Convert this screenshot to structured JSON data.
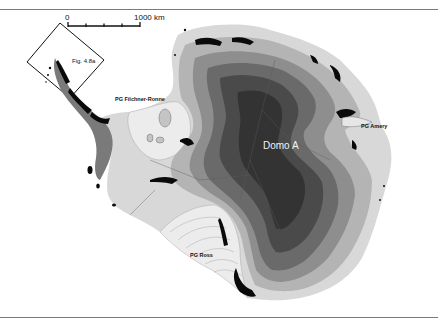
{
  "map": {
    "type": "ice-sheet-elevation-map",
    "region": "Antarctica",
    "labels": {
      "domo": "Domo A",
      "filchner_ronne": "PG Filchner-Ronne",
      "amery": "PG Amery",
      "ross": "PG Ross",
      "figure_box": "Fig. 4.8a"
    },
    "scale_bar": {
      "start_label": "0",
      "end_label": "1000 km",
      "ticks": 5
    },
    "colors": {
      "background": "#ffffff",
      "rule": "#7a7a7a",
      "band_1": "#d8d8d8",
      "band_2": "#b4b4b4",
      "band_3": "#8e8e8e",
      "band_4": "#6a6a6a",
      "band_5": "#4a4a4a",
      "band_6": "#333333",
      "ice_shelf": "#e6e6e6",
      "rock": "#0a0a0a"
    }
  }
}
